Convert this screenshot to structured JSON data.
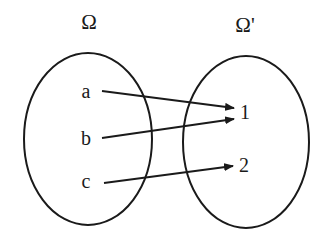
{
  "diagram": {
    "type": "function-mapping",
    "domain_set": {
      "label": "Ω",
      "elements": [
        "a",
        "b",
        "c"
      ]
    },
    "codomain_set": {
      "label": "Ω'",
      "elements": [
        "1",
        "2"
      ]
    },
    "mappings": [
      {
        "from": "a",
        "to": "1"
      },
      {
        "from": "b",
        "to": "1"
      },
      {
        "from": "c",
        "to": "2"
      }
    ],
    "colors": {
      "stroke": "#1a1a1a",
      "background": "#ffffff"
    }
  }
}
